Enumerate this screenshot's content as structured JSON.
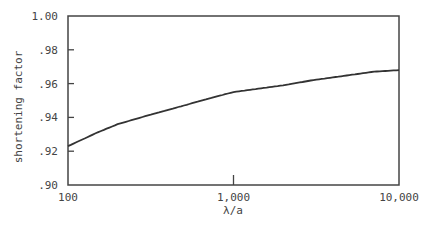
{
  "chart_data": {
    "type": "line",
    "title": "",
    "xlabel": "λ/a",
    "ylabel": "shortening factor",
    "xscale": "log",
    "xlim": [
      100,
      10000
    ],
    "ylim": [
      0.9,
      1.0
    ],
    "x_ticks": [
      "100",
      "1,000",
      "10,000"
    ],
    "y_ticks": [
      ".90",
      ".92",
      ".94",
      ".96",
      ".98",
      "1.00"
    ],
    "grid": false,
    "legend": null,
    "series": [
      {
        "name": "shortening factor",
        "x": [
          100,
          150,
          200,
          300,
          500,
          700,
          1000,
          2000,
          3000,
          5000,
          7000,
          10000
        ],
        "values": [
          0.923,
          0.931,
          0.936,
          0.941,
          0.947,
          0.951,
          0.955,
          0.959,
          0.962,
          0.965,
          0.967,
          0.968
        ]
      }
    ]
  },
  "labels": {
    "xlabel": "λ/a",
    "ylabel": "shortening factor",
    "x_ticks": [
      "100",
      "1,000",
      "10,000"
    ],
    "y_ticks": [
      ".90",
      ".92",
      ".94",
      ".96",
      ".98",
      "1.00"
    ]
  },
  "colors": {
    "line": "#333333",
    "axis": "#444444"
  }
}
